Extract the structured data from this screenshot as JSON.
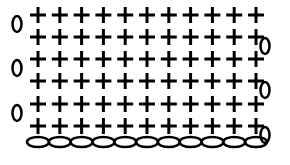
{
  "diagram": {
    "type": "crochet-chart",
    "stitch_symbol": "+",
    "stitch_name": "single-crochet",
    "chain_symbol": "0",
    "rows": 6,
    "stitches_per_row": 11,
    "foundation_chain_count": 11,
    "turning_chains": [
      {
        "row": 6,
        "side": "left"
      },
      {
        "row": 5,
        "side": "right"
      },
      {
        "row": 4,
        "side": "left"
      },
      {
        "row": 3,
        "side": "right"
      },
      {
        "row": 2,
        "side": "left"
      },
      {
        "row": 1,
        "side": "right"
      }
    ],
    "color": "#000000"
  }
}
